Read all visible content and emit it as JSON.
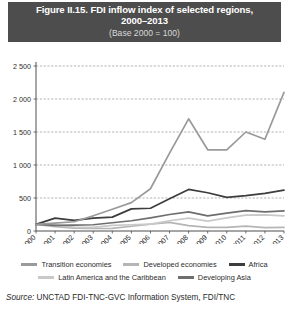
{
  "title": {
    "line1": "Figure II.15. FDI inflow index of selected regions,",
    "line2": "2000–2013",
    "subtitle": "(Base 2000 = 100)"
  },
  "source": {
    "label": "Source:",
    "text": " UNCTAD FDI-TNC-GVC Information System, FDI/TNC"
  },
  "legend": {
    "row1": [
      {
        "label": "Transition economies",
        "color": "#9a9a9a"
      },
      {
        "label": "Developed economies",
        "color": "#b5b5b5"
      },
      {
        "label": "Africa",
        "color": "#3d3d3d"
      }
    ],
    "row2": [
      {
        "label": "Latin America and the Caribbean",
        "color": "#c9c9c9"
      },
      {
        "label": "Developing  Asia",
        "color": "#6e6e6e"
      }
    ]
  },
  "chart_data": {
    "type": "line",
    "title": "Figure II.15. FDI inflow index of selected regions, 2000–2013",
    "subtitle": "(Base 2000 = 100)",
    "xlabel": "",
    "ylabel": "",
    "ylim": [
      0,
      2500
    ],
    "yticks": [
      0,
      500,
      1000,
      1500,
      2000,
      2500
    ],
    "ytick_labels": [
      "0",
      "500",
      "1 000",
      "1 500",
      "2 000",
      "2 500"
    ],
    "grid": true,
    "legend_position": "bottom",
    "categories": [
      "2000",
      "2001",
      "2002",
      "2003",
      "2004",
      "2005",
      "2006",
      "2007",
      "2008",
      "2009",
      "2010",
      "2011",
      "2012",
      "2013"
    ],
    "series": [
      {
        "name": "Transition economies",
        "color": "#9a9a9a",
        "values": [
          100,
          120,
          140,
          230,
          330,
          430,
          640,
          1180,
          1700,
          1230,
          1230,
          1500,
          1390,
          2100
        ]
      },
      {
        "name": "Developed economies",
        "color": "#b5b5b5",
        "values": [
          100,
          65,
          45,
          38,
          40,
          72,
          105,
          130,
          82,
          55,
          55,
          75,
          50,
          55
        ]
      },
      {
        "name": "Africa",
        "color": "#3d3d3d",
        "values": [
          100,
          195,
          160,
          195,
          210,
          335,
          345,
          490,
          630,
          580,
          510,
          535,
          570,
          620
        ]
      },
      {
        "name": "Latin America and the Caribbean",
        "color": "#c9c9c9",
        "values": [
          100,
          90,
          60,
          55,
          85,
          95,
          105,
          155,
          195,
          150,
          200,
          240,
          245,
          230
        ]
      },
      {
        "name": "Developing  Asia",
        "color": "#6e6e6e",
        "values": [
          100,
          85,
          90,
          95,
          125,
          155,
          200,
          250,
          290,
          230,
          270,
          310,
          290,
          305
        ]
      }
    ]
  }
}
